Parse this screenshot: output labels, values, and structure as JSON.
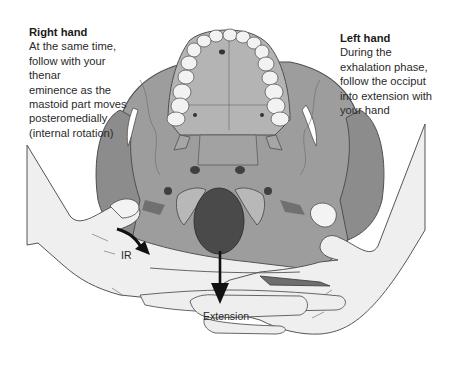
{
  "annotations": {
    "right_hand": {
      "title": "Right hand",
      "text": "At the same time,\nfollow with your thenar\neminence as the\nmastoid part moves\nposteromedially\n(internal rotation)"
    },
    "left_hand": {
      "title": "Left hand",
      "text": "During the\nexhalation phase,\nfollow the occiput\ninto extension with\nyour hand"
    }
  },
  "motion_labels": {
    "internal_rotation": "IR",
    "extension": "Extension"
  },
  "colors": {
    "background": "#ffffff",
    "skull_fill": "#9a9a9a",
    "skull_dark": "#6e6e6e",
    "teeth_fill": "#f2f2f2",
    "foramen_magnum": "#4a4a4a",
    "hand_fill": "#efefef",
    "outline": "#555555",
    "arrow": "#111111",
    "text": "#2a2a2a"
  }
}
